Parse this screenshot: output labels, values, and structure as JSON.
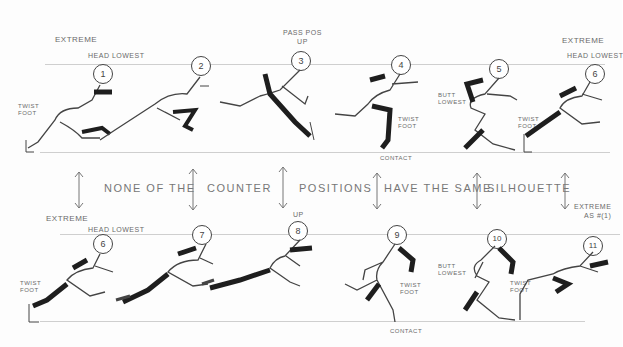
{
  "top_row": {
    "frames": [
      {
        "num": "1",
        "notes": [
          "EXTREME",
          "HEAD LOWEST",
          "TWIST\nFOOT"
        ]
      },
      {
        "num": "2",
        "notes": []
      },
      {
        "num": "3",
        "notes": [
          "PASS POS\nUP"
        ]
      },
      {
        "num": "4",
        "notes": [
          "TWIST\nFOOT",
          "CONTACT"
        ]
      },
      {
        "num": "5",
        "notes": [
          "BUTT\nLOWEST"
        ]
      },
      {
        "num": "6",
        "notes": [
          "EXTREME",
          "HEAD LOWEST",
          "TWIST\nFOOT"
        ]
      }
    ]
  },
  "middle_caption": {
    "words": [
      "NONE OF THE",
      "COUNTER",
      "POSITIONS",
      "HAVE THE SAME",
      "SILHOUETTE"
    ],
    "side_note": "EXTREME\nAS #(1)"
  },
  "bottom_row": {
    "frames": [
      {
        "num": "6",
        "notes": [
          "EXTREME",
          "HEAD LOWEST",
          "TWIST\nFOOT"
        ]
      },
      {
        "num": "7",
        "notes": []
      },
      {
        "num": "8",
        "notes": [
          "UP"
        ]
      },
      {
        "num": "9",
        "notes": [
          "TWIST\nFOOT",
          "CONTACT"
        ]
      },
      {
        "num": "10",
        "notes": [
          "BUTT\nLOWEST"
        ]
      },
      {
        "num": "11",
        "notes": [
          "TWIST\nFOOT"
        ]
      }
    ]
  },
  "colors": {
    "pencil": "#444444",
    "shade": "#1e1e1e",
    "guide": "#cfcfcf",
    "paper": "#fdfdfd"
  }
}
